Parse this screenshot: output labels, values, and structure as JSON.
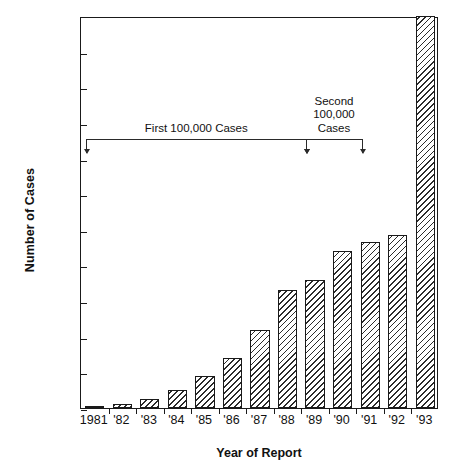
{
  "chart_data": {
    "type": "bar",
    "title": "",
    "xlabel": "Year of Report",
    "ylabel": "Number of Cases",
    "categories": [
      "1981",
      "'82",
      "'83",
      "'84",
      "'85",
      "'86",
      "'87",
      "'88",
      "'89",
      "'90",
      "'91",
      "'92",
      "'93"
    ],
    "values": [
      300,
      1000,
      2500,
      5000,
      9000,
      14000,
      22000,
      33000,
      36000,
      44000,
      46500,
      48500,
      110000
    ],
    "ylim": [
      0,
      110000
    ],
    "ytick_labels": [
      "0",
      "10,000",
      "20,000",
      "30,000",
      "40,000",
      "50,000",
      "60,000",
      "70,000",
      "80,000",
      "90,000",
      "100,000",
      "110,000"
    ],
    "ytick_values": [
      0,
      10000,
      20000,
      30000,
      40000,
      50000,
      60000,
      70000,
      80000,
      90000,
      100000,
      110000
    ],
    "grid": false,
    "legend": null,
    "bar_style": "diagonal-hatch",
    "annotations": [
      {
        "id": "first-100000",
        "label": "First 100,000 Cases",
        "label_lines": [
          "First 100,000 Cases"
        ],
        "span_from_category": "1981",
        "span_to_category": "'89",
        "bracket_y_value": 76000
      },
      {
        "id": "second-100000",
        "label": "Second 100,000 Cases",
        "label_lines": [
          "Second",
          "100,000",
          "Cases"
        ],
        "span_from_category": "'89",
        "span_to_category": "'91",
        "bracket_y_value": 76000
      }
    ]
  },
  "colors": {
    "axis": "#1a1a1a",
    "bar_edge": "#1a1a1a",
    "bar_hatch": "#2b2b2b",
    "background": "#ffffff",
    "annotation": "#2a2a2a",
    "text": "#111111"
  }
}
